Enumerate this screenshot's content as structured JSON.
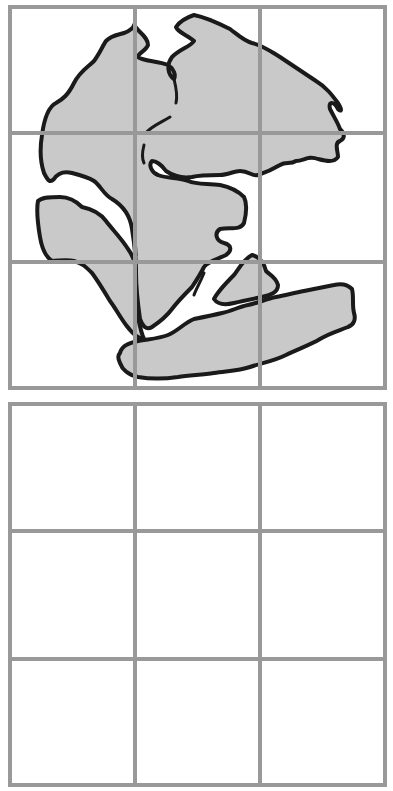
{
  "figure": {
    "colors": {
      "grid_line": "#999999",
      "land_fill": "#c9c9c9",
      "coastline": "#1a1a1a",
      "background": "#ffffff"
    },
    "top_grid": {
      "rows": 3,
      "cols": 3,
      "content": "pangaea-map"
    },
    "bottom_grid": {
      "rows": 3,
      "cols": 3,
      "content": "empty"
    }
  }
}
